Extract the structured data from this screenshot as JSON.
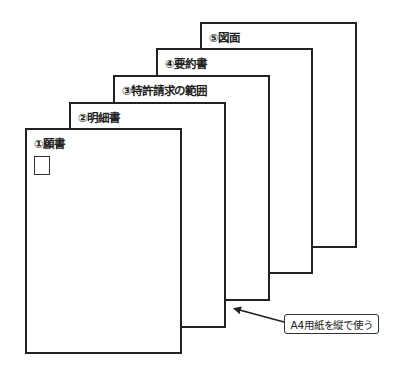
{
  "diagram": {
    "pages": [
      {
        "id": "page-5",
        "label": "⑤図面",
        "x": 200,
        "y": 22,
        "w": 157,
        "h": 226
      },
      {
        "id": "page-4",
        "label": "④要約書",
        "x": 156,
        "y": 48,
        "w": 157,
        "h": 226
      },
      {
        "id": "page-3",
        "label": "③特許請求の範囲",
        "x": 113,
        "y": 75,
        "w": 157,
        "h": 226
      },
      {
        "id": "page-2",
        "label": "②明細書",
        "x": 69,
        "y": 102,
        "w": 157,
        "h": 226
      },
      {
        "id": "page-1",
        "label": "①願書",
        "x": 25,
        "y": 128,
        "w": 157,
        "h": 226
      }
    ],
    "seal_box": {
      "x": 34,
      "y": 156,
      "w": 16,
      "h": 19
    },
    "callout": {
      "text": "A4用紙を縦で使う",
      "x": 284,
      "y": 314,
      "w": 95,
      "h": 20
    },
    "arrow": {
      "from": [
        284,
        322
      ],
      "to": [
        233,
        308
      ]
    },
    "colors": {
      "stroke": "#222222",
      "background": "#ffffff"
    }
  }
}
